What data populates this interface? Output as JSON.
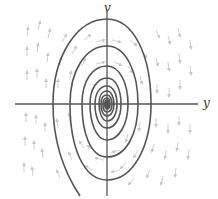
{
  "diagram": {
    "type": "phase-portrait",
    "axes": {
      "horizontal_label": "y",
      "vertical_label": "v"
    },
    "direction_field": {
      "description": "clockwise rotation; arrows point up on left half, down on right half",
      "arrow_color": "#c8c8c8"
    },
    "trajectory": {
      "description": "spiral converging to origin (stable spiral sink)",
      "color": "#555555"
    },
    "axis_color": "#555555"
  }
}
